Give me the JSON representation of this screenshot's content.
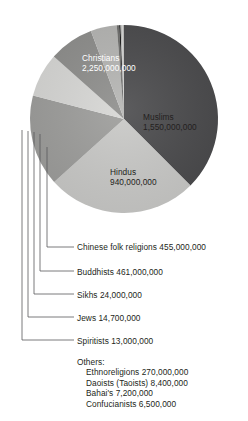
{
  "chart_data": {
    "type": "pie",
    "title": "",
    "subtitle": "",
    "xlabel": "",
    "ylabel": "",
    "legend_position": "callout-labels",
    "grid": false,
    "total": 5532800000,
    "units": "adherents",
    "categories": [
      "Christians",
      "Muslims",
      "Hindus",
      "Chinese folk religions",
      "Buddhists",
      "Ethnoreligions",
      "Sikhs",
      "Jews",
      "Spiritists",
      "Daoists (Taoists)",
      "Bahai's",
      "Confucianists"
    ],
    "values": [
      2250000000,
      1550000000,
      940000000,
      455000000,
      461000000,
      270000000,
      24000000,
      14700000,
      13000000,
      8400000,
      7200000,
      6500000
    ],
    "value_labels": [
      "2,250,000,000",
      "1,550,000,000",
      "940,000,000",
      "455,000,000",
      "461,000,000",
      "270,000,000",
      "24,000,000",
      "14,700,000",
      "13,000,000",
      "8,400,000",
      "7,200,000",
      "6,500,000"
    ],
    "slice_colors": [
      "#4a4a4c",
      "#c9c9c7",
      "#9d9d9b",
      "#d7d7d5",
      "#8e8e8c",
      "#b5b5b3",
      "#6f6f6d",
      "#1a1a1a",
      "#bdbdbb",
      "#c9c9c7",
      "#d7d7d5",
      "#9d9d9b"
    ]
  },
  "pie": {
    "slices": [
      {
        "name": "Christians",
        "label": "Christians",
        "value_label": "2,250,000,000",
        "color": "#4a4a4c",
        "text_on": "dark"
      },
      {
        "name": "Muslims",
        "label": "Muslims",
        "value_label": "1,550,000,000",
        "color": "#c9c9c7",
        "text_on": "light"
      },
      {
        "name": "Hindus",
        "label": "Hindus",
        "value_label": "940,000,000",
        "color": "#9d9d9b",
        "text_on": "light"
      }
    ]
  },
  "callouts": [
    {
      "name": "chinese-folk-religions",
      "text": "Chinese folk religions 455,000,000"
    },
    {
      "name": "buddhists",
      "text": "Buddhists 461,000,000"
    },
    {
      "name": "sikhs",
      "text": "Sikhs 24,000,000"
    },
    {
      "name": "jews",
      "text": "Jews 14,700,000"
    },
    {
      "name": "spiritists",
      "text": "Spiritists 13,000,000"
    }
  ],
  "others": {
    "heading": "Others:",
    "items": [
      "Ethnoreligions 270,000,000",
      "Daoists (Taoists) 8,400,000",
      "Bahai's 7,200,000",
      "Confucianists 6,500,000"
    ]
  }
}
